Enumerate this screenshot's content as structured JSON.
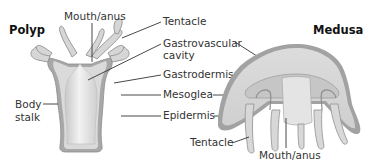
{
  "diagram": {
    "polyp": {
      "title": "Polyp",
      "labels": {
        "mouth_anus": "Mouth/anus",
        "body_stalk_line1": "Body",
        "body_stalk_line2": "stalk"
      }
    },
    "shared_labels": {
      "tentacle": "Tentacle",
      "gastrovascular_line1": "Gastrovascular",
      "gastrovascular_line2": "cavity",
      "gastrodermis": "Gastrodermis",
      "mesoglea": "Mesoglea",
      "epidermis": "Epidermis"
    },
    "medusa": {
      "title": "Medusa",
      "labels": {
        "tentacle": "Tentacle",
        "mouth_anus": "Mouth/anus"
      }
    },
    "colors": {
      "epidermis": "#9a9a9a",
      "mesoglea": "#d9d9d9",
      "gastrodermis": "#c4c4c4",
      "cavity": "#e8e8e8",
      "text": "#333333",
      "title": "#111111"
    }
  }
}
